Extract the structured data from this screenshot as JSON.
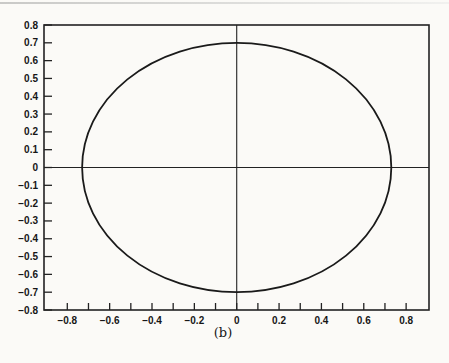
{
  "page": {
    "background": "#fbfaf7",
    "top_rule": "page-edge-rule"
  },
  "chart_data": {
    "type": "line",
    "subtype": "closed-curve-ellipse",
    "title": "",
    "xlabel": "",
    "ylabel": "",
    "caption": "(b)",
    "grid": false,
    "frame": true,
    "zero_axes_cross": true,
    "legend": null,
    "xlim": [
      -0.91,
      0.908
    ],
    "ylim": [
      -0.8,
      0.8
    ],
    "x_axis": {
      "tick_step": 0.1,
      "tick_values": [
        -0.8,
        -0.7,
        -0.6,
        -0.5,
        -0.4,
        -0.3,
        -0.2,
        -0.1,
        0,
        0.1,
        0.2,
        0.3,
        0.4,
        0.5,
        0.6,
        0.7,
        0.8
      ],
      "label_values": [
        -0.8,
        -0.6,
        -0.4,
        -0.2,
        0,
        0.2,
        0.4,
        0.6,
        0.8
      ],
      "labels": [
        "−0.8",
        "−0.6",
        "−0.4",
        "−0.2",
        "0",
        "0.2",
        "0.4",
        "0.6",
        "0.8"
      ]
    },
    "y_axis": {
      "tick_step": 0.1,
      "tick_values": [
        0.8,
        0.7,
        0.6,
        0.5,
        0.4,
        0.3,
        0.2,
        0.1,
        0,
        -0.1,
        -0.2,
        -0.3,
        -0.4,
        -0.5,
        -0.6,
        -0.7,
        -0.8
      ],
      "label_values": [
        0.8,
        0.7,
        0.6,
        0.5,
        0.4,
        0.3,
        0.2,
        0.1,
        0,
        -0.1,
        -0.2,
        -0.3,
        -0.4,
        -0.5,
        -0.6,
        -0.7,
        -0.8
      ],
      "labels": [
        "0.8",
        "0.7",
        "0.6",
        "0.5",
        "0.4",
        "0.3",
        "0.2",
        "0.1",
        "0",
        "−0.1",
        "−0.2",
        "−0.3",
        "−0.4",
        "−0.5",
        "−0.6",
        "−0.7",
        "−0.8"
      ]
    },
    "series": [
      {
        "name": "ellipse-curve",
        "shape": "ellipse",
        "center": [
          0,
          0
        ],
        "semi_axis_x": 0.73,
        "semi_axis_y": 0.7
      }
    ],
    "colors": {
      "line": "#222222",
      "curve": "#1a1a1a",
      "text": "#161616",
      "paper": "#fbfaf7"
    }
  }
}
